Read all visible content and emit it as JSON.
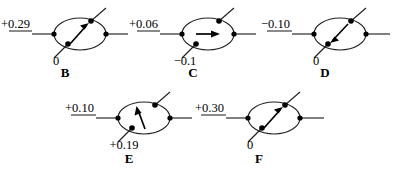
{
  "figure": {
    "type": "diagram",
    "background_color": "#ffffff",
    "ink_color": "#000000",
    "panels": [
      {
        "id": "B",
        "letter": "B",
        "top_label": "+0.29",
        "bottom_label": "0",
        "arrow_direction": "up-right",
        "arrow_angle_deg": 52,
        "has_top_label_underline": true,
        "has_bottom_label_underline": false
      },
      {
        "id": "C",
        "letter": "C",
        "top_label": "+0.06",
        "bottom_label": "−0.1",
        "arrow_direction": "right",
        "arrow_angle_deg": 0,
        "has_top_label_underline": true,
        "has_bottom_label_underline": false
      },
      {
        "id": "D",
        "letter": "D",
        "top_label": "−0.10",
        "bottom_label": "0",
        "arrow_direction": "down-left",
        "arrow_angle_deg": 235,
        "has_top_label_underline": true,
        "has_bottom_label_underline": false
      },
      {
        "id": "E",
        "letter": "E",
        "top_label": "+0.10",
        "bottom_label": "+0.19",
        "arrow_direction": "up-slightly-left",
        "arrow_angle_deg": 104,
        "has_top_label_underline": true,
        "has_bottom_label_underline": false
      },
      {
        "id": "F",
        "letter": "F",
        "top_label": "+0.30",
        "bottom_label": "0",
        "arrow_direction": "up-right",
        "arrow_angle_deg": 50,
        "has_top_label_underline": true,
        "has_bottom_label_underline": false
      }
    ]
  }
}
